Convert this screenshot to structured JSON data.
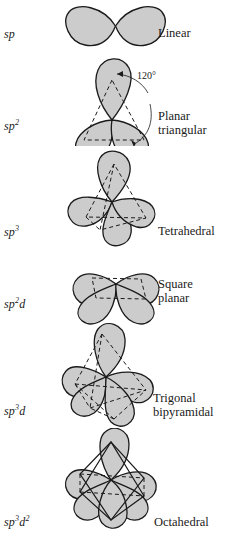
{
  "figure": {
    "background": "#ffffff",
    "lobe_fill": "#cccccc",
    "lobe_stroke": "#1a1a1a",
    "dash_stroke": "#1a1a1a"
  },
  "rows": [
    {
      "hybrid_main": "sp",
      "hybrid_sup": "",
      "hybrid_sup2_base": "",
      "hybrid_sup2": "",
      "geometry_line1": "Linear",
      "geometry_line2": "",
      "annotation": ""
    },
    {
      "hybrid_main": "sp",
      "hybrid_sup": "2",
      "hybrid_sup2_base": "",
      "hybrid_sup2": "",
      "geometry_line1": "Planar",
      "geometry_line2": "triangular",
      "annotation": "120°"
    },
    {
      "hybrid_main": "sp",
      "hybrid_sup": "3",
      "hybrid_sup2_base": "",
      "hybrid_sup2": "",
      "geometry_line1": "Tetrahedral",
      "geometry_line2": "",
      "annotation": ""
    },
    {
      "hybrid_main": "sp",
      "hybrid_sup": "2",
      "hybrid_sup2_base": "d",
      "hybrid_sup2": "",
      "geometry_line1": "Square",
      "geometry_line2": "planar",
      "annotation": ""
    },
    {
      "hybrid_main": "sp",
      "hybrid_sup": "3",
      "hybrid_sup2_base": "d",
      "hybrid_sup2": "",
      "geometry_line1": "Trigonal",
      "geometry_line2": "bipyramidal",
      "annotation": ""
    },
    {
      "hybrid_main": "sp",
      "hybrid_sup": "3",
      "hybrid_sup2_base": "d",
      "hybrid_sup2": "2",
      "geometry_line1": "Octahedral",
      "geometry_line2": "",
      "annotation": ""
    }
  ]
}
